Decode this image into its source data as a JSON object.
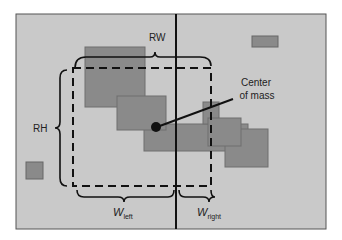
{
  "diagram": {
    "labels": {
      "rw": "RW",
      "rh": "RH",
      "center_line1": "Center",
      "center_line2": "of mass",
      "w_left_main": "W",
      "w_left_sub": "left",
      "w_right_main": "W",
      "w_right_sub": "right"
    },
    "colors": {
      "background": "#c9c9c9",
      "rect_fill": "#8a8a8a",
      "rect_stroke": "#6e6e6e",
      "line": "#111111"
    }
  }
}
